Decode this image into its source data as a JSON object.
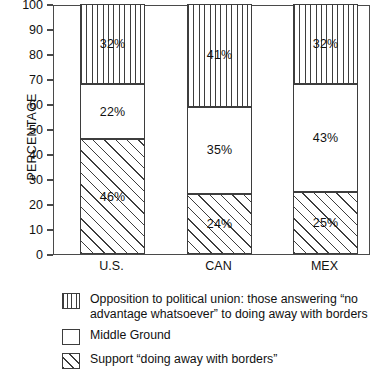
{
  "chart_data": {
    "type": "bar",
    "subtype": "stacked-bar-100",
    "title": "",
    "xlabel": "",
    "ylabel": "PERCENTAGE",
    "ylim": [
      0,
      100
    ],
    "ytick_step": 10,
    "yticks": [
      100,
      90,
      80,
      70,
      60,
      50,
      40,
      30,
      20,
      10,
      0
    ],
    "grid": false,
    "legend_position": "below-plot",
    "categories": [
      "U.S.",
      "CAN",
      "MEX"
    ],
    "series": [
      {
        "name": "Support “doing away with borders”",
        "pattern": "diagonal-hatch",
        "stack_order": 0,
        "values": [
          46,
          24,
          25
        ],
        "labels": [
          "46%",
          "24%",
          "25%"
        ]
      },
      {
        "name": "Middle Ground",
        "pattern": "empty",
        "stack_order": 1,
        "values": [
          22,
          35,
          43
        ],
        "labels": [
          "22%",
          "35%",
          "43%"
        ]
      },
      {
        "name": "Opposition to political union: those answering “no advantage whatsoever” to doing away with borders",
        "pattern": "vertical-hatch",
        "stack_order": 2,
        "values": [
          32,
          41,
          32
        ],
        "labels": [
          "32%",
          "41%",
          "32%"
        ]
      }
    ],
    "colors": {
      "background": "#ffffff",
      "axis": "#4a4a4a",
      "pattern_stroke": "#3d3d3d",
      "text": "#111111"
    }
  },
  "axis": {
    "y_title": "PERCENTAGE",
    "y_ticks": [
      "100",
      "90",
      "80",
      "70",
      "60",
      "50",
      "40",
      "30",
      "20",
      "10",
      "0"
    ],
    "x_categories": [
      "U.S.",
      "CAN",
      "MEX"
    ]
  },
  "bars": [
    {
      "category": "U.S.",
      "segments": [
        {
          "label": "32%",
          "value": 32,
          "pattern": "vertical-hatch"
        },
        {
          "label": "22%",
          "value": 22,
          "pattern": "empty"
        },
        {
          "label": "46%",
          "value": 46,
          "pattern": "diagonal-hatch"
        }
      ]
    },
    {
      "category": "CAN",
      "segments": [
        {
          "label": "41%",
          "value": 41,
          "pattern": "vertical-hatch"
        },
        {
          "label": "35%",
          "value": 35,
          "pattern": "empty"
        },
        {
          "label": "24%",
          "value": 24,
          "pattern": "diagonal-hatch"
        }
      ]
    },
    {
      "category": "MEX",
      "segments": [
        {
          "label": "32%",
          "value": 32,
          "pattern": "vertical-hatch"
        },
        {
          "label": "43%",
          "value": 43,
          "pattern": "empty"
        },
        {
          "label": "25%",
          "value": 25,
          "pattern": "diagonal-hatch"
        }
      ]
    }
  ],
  "legend": {
    "items": [
      {
        "pattern": "vertical-hatch",
        "label": "Opposition to political union: those answering “no advantage whatsoever” to doing away with borders"
      },
      {
        "pattern": "empty",
        "label": "Middle Ground"
      },
      {
        "pattern": "diagonal-hatch",
        "label": "Support “doing away with borders”"
      }
    ]
  }
}
